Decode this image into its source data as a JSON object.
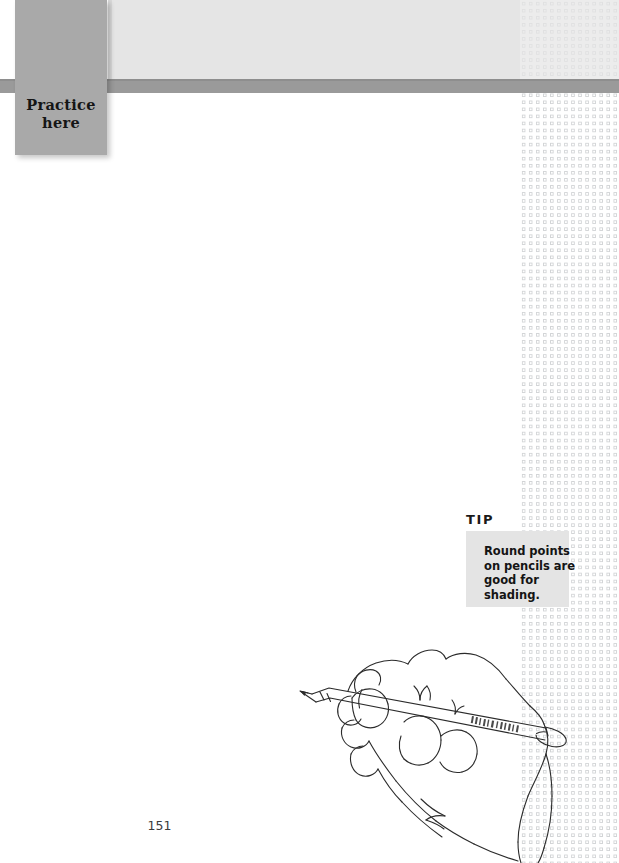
{
  "page": {
    "number": "151",
    "background_color": "#ffffff",
    "width": 619,
    "height": 863
  },
  "header": {
    "band_color": "#e5e5e5",
    "rule_color": "#9a9a9a"
  },
  "practice_tab": {
    "label": "Practice\nhere",
    "background_color": "#a9a9a9",
    "text_color": "#151515"
  },
  "dot_pattern": {
    "name": "dotted-circle-grid",
    "dot_color": "#d2d4d6",
    "spacing_px": 7
  },
  "tip": {
    "heading": "TIP",
    "body": "Round points on pencils are good for shading.",
    "box_color": "#e4e4e4",
    "text_color": "#141414"
  },
  "illustration": {
    "name": "hand-holding-pencil",
    "description": "Line drawing of a hand holding a pencil",
    "stroke_color": "#2b2b2b"
  }
}
